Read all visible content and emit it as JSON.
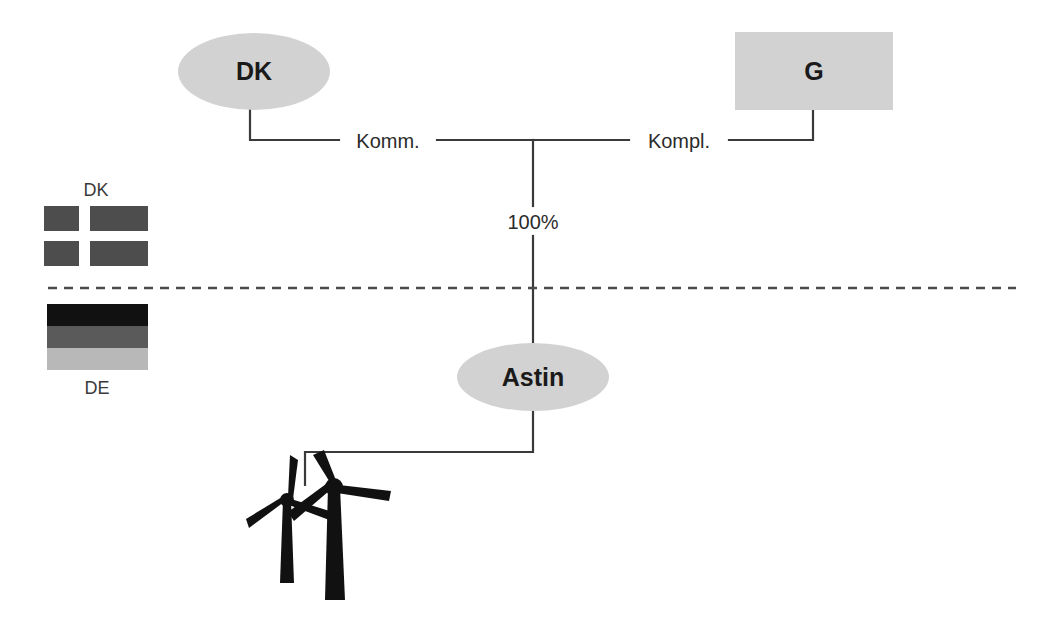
{
  "diagram": {
    "type": "org-ownership-chart",
    "colors": {
      "node_fill": "#d2d2d2",
      "connector": "#3a3a3a",
      "divider": "#4a4a4a",
      "text": "#1a1a1a",
      "turbine": "#111111",
      "background": "#ffffff"
    },
    "nodes": [
      {
        "id": "dk",
        "label": "DK",
        "shape": "ellipse"
      },
      {
        "id": "g",
        "label": "G",
        "shape": "rectangle"
      },
      {
        "id": "astin",
        "label": "Astin",
        "shape": "ellipse"
      }
    ],
    "edge_labels": {
      "left": "Komm.",
      "right": "Kompl.",
      "ownership": "100%"
    },
    "divider": {
      "style": "dashed",
      "meaning": "country-border"
    },
    "flags": [
      {
        "id": "flag-dk",
        "caption": "DK",
        "caption_position": "above",
        "country": "Denmark",
        "design": "nordic-cross",
        "bands": [
          "#4d4d4d"
        ]
      },
      {
        "id": "flag-de",
        "caption": "DE",
        "caption_position": "below",
        "country": "Germany",
        "design": "horizontal-tricolor",
        "bands": [
          "#111111",
          "#5a5a5a",
          "#b8b8b8"
        ]
      }
    ],
    "assets": {
      "id": "wind-farm",
      "icon": "wind-turbine-icon",
      "count": 2
    }
  }
}
